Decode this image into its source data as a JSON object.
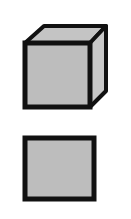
{
  "figure": {
    "shapes": [
      {
        "id": "cube",
        "kind": "3d-cube",
        "fill": "#bdbdbd",
        "stroke": "#111111"
      },
      {
        "id": "square",
        "kind": "2d-square",
        "fill": "#bdbdbd",
        "stroke": "#111111"
      }
    ]
  }
}
